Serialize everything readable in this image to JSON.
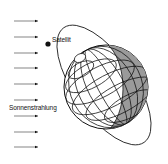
{
  "diagram": {
    "labels": {
      "satellite": "Satellit",
      "sunlight": "Sonnenstrahlung"
    },
    "arrows": {
      "count": 9,
      "y_positions": [
        21,
        37,
        53,
        68,
        84,
        100,
        116,
        132,
        147
      ],
      "direction": "right"
    },
    "colors": {
      "line": "#111111",
      "shadow": "#9a9a9a",
      "background": "#ffffff"
    }
  }
}
